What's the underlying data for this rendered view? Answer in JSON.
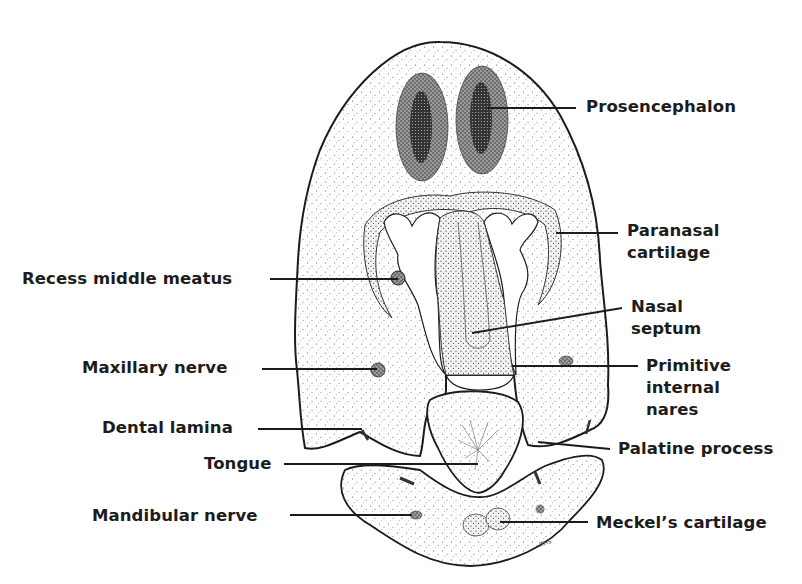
{
  "figure": {
    "type": "anatomical-cross-section",
    "signature": "RHS",
    "ink_color": "#1c1c1c",
    "background": "#ffffff"
  },
  "labels": {
    "left": [
      {
        "id": "recess-middle-meatus",
        "text": "Recess  middle meatus",
        "x": 22,
        "y": 268,
        "line": [
          270,
          279,
          398,
          279
        ]
      },
      {
        "id": "maxillary-nerve",
        "text": "Maxillary nerve",
        "x": 82,
        "y": 357,
        "line": [
          262,
          369,
          377,
          369
        ]
      },
      {
        "id": "dental-lamina",
        "text": "Dental lamina",
        "x": 102,
        "y": 417,
        "line": [
          258,
          429,
          362,
          429
        ]
      },
      {
        "id": "tongue",
        "text": "Tongue",
        "x": 204,
        "y": 453,
        "line": [
          284,
          464,
          478,
          464
        ]
      },
      {
        "id": "mandibular-nerve",
        "text": "Mandibular nerve",
        "x": 92,
        "y": 505,
        "line": [
          290,
          515,
          412,
          515
        ]
      }
    ],
    "right": [
      {
        "id": "prosencephalon",
        "text": "Prosencephalon",
        "lines": [
          "Prosencephalon"
        ],
        "x": 586,
        "y": 96,
        "line": [
          487,
          108,
          576,
          108
        ]
      },
      {
        "id": "paranasal-cartilage",
        "text": "Paranasal cartilage",
        "lines": [
          "Paranasal",
          "cartilage"
        ],
        "x": 627,
        "y": 222,
        "line": [
          556,
          233,
          618,
          233
        ]
      },
      {
        "id": "nasal-septum",
        "text": "Nasal septum",
        "lines": [
          "Nasal",
          "septum"
        ],
        "x": 631,
        "y": 297,
        "line": [
          472,
          333,
          622,
          308
        ]
      },
      {
        "id": "primitive-internal-nares",
        "text": "Primitive internal nares",
        "lines": [
          "Primitive",
          "internal",
          "nares"
        ],
        "x": 646,
        "y": 356,
        "line": [
          512,
          366,
          638,
          366
        ]
      },
      {
        "id": "palatine-process",
        "text": "Palatine process",
        "lines": [
          "Palatine process"
        ],
        "x": 618,
        "y": 438,
        "line": [
          538,
          442,
          610,
          449
        ]
      },
      {
        "id": "meckels-cartilage",
        "text": "Meckel’s cartilage",
        "lines": [
          "Meckel’s cartilage"
        ],
        "x": 596,
        "y": 513,
        "line": [
          500,
          522,
          588,
          522
        ]
      }
    ]
  }
}
